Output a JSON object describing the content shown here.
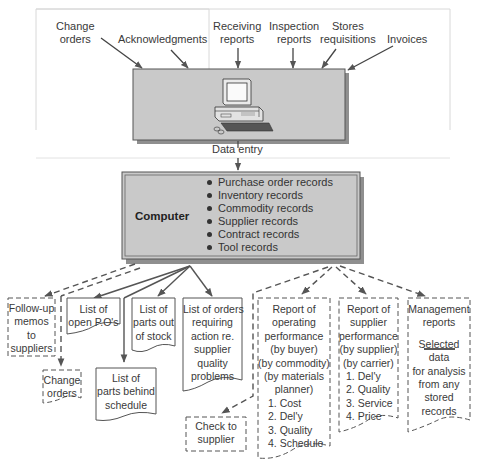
{
  "inputs": [
    {
      "label_line1": "Change",
      "label_line2": "orders"
    },
    {
      "label_line1": "Acknowledgments",
      "label_line2": ""
    },
    {
      "label_line1": "Receiving",
      "label_line2": "reports"
    },
    {
      "label_line1": "Inspection",
      "label_line2": "reports"
    },
    {
      "label_line1": "Stores",
      "label_line2": "requisitions"
    },
    {
      "label_line1": "Invoices",
      "label_line2": ""
    }
  ],
  "data_entry": {
    "label": "Data entry",
    "icon": "desktop-computer-icon"
  },
  "computer": {
    "title": "Computer",
    "records": [
      "Purchase order records",
      "Inventory records",
      "Commodity records",
      "Supplier records",
      "Contract records",
      "Tool records"
    ]
  },
  "outputs": {
    "followup": [
      "Follow-up",
      "memos",
      "to",
      "suppliers"
    ],
    "change_orders": [
      "Change",
      "orders"
    ],
    "open_pos": [
      "List of",
      "open P.O's"
    ],
    "behind_schedule": [
      "List of",
      "parts behind",
      "schedule"
    ],
    "out_of_stock": [
      "List of",
      "parts out",
      "of stock"
    ],
    "quality_problems": [
      "List of orders",
      "requiring",
      "action re.",
      "supplier",
      "quality",
      "problems"
    ],
    "check_supplier": [
      "Check to",
      "supplier"
    ],
    "operating_perf": [
      "Report of",
      "operating",
      "performance",
      "(by buyer)",
      "(by commodity)",
      "(by materials",
      "planner)",
      "1. Cost",
      "2. Del'y",
      "3. Quality",
      "4. Schedule"
    ],
    "supplier_perf": [
      "Report of",
      "supplier",
      "performance",
      "(by supplier)",
      "(by carrier)",
      "1. Del'y",
      "2. Quality",
      "3. Service",
      "4. Price"
    ],
    "management": [
      "Management",
      "reports",
      "Selected",
      "data",
      "for analysis",
      "from any",
      "stored",
      "records"
    ]
  },
  "colors": {
    "panel_gray": "#c9c9c9",
    "shadow_gray": "#8f8f8f",
    "line": "#555555",
    "text": "#3a3a3a"
  }
}
